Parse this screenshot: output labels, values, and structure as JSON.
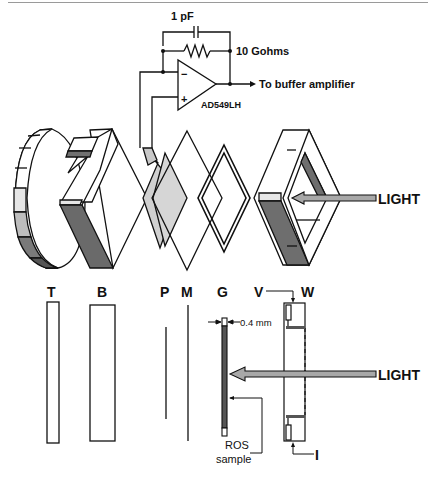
{
  "circuit": {
    "capacitor_label": "1 pF",
    "resistor_label": "10 Gohms",
    "output_label": "To buffer amplifier",
    "opamp_label": "AD549LH",
    "minus_sign": "−",
    "plus_sign": "+"
  },
  "exploded_view": {
    "light_label": "LIGHT"
  },
  "component_labels": {
    "T": "T",
    "B": "B",
    "P": "P",
    "M": "M",
    "G": "G",
    "V": "V",
    "W": "W",
    "I": "I"
  },
  "side_view": {
    "thickness_label": "0.4 mm",
    "light_label": "LIGHT",
    "sample_label_line1": "ROS",
    "sample_label_line2": "sample"
  },
  "colors": {
    "line": "#111111",
    "dark_fill": "#6e6e6e",
    "light_fill": "#c8c8c8",
    "pale_fill": "#e6e6e6",
    "arrow_fill": "#a8a8a8"
  }
}
